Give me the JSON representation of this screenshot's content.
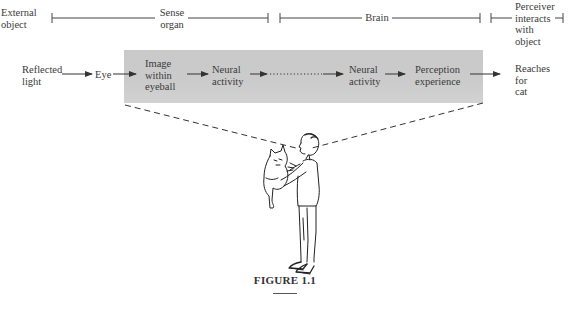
{
  "figure": {
    "caption": "FIGURE 1.1",
    "stages": {
      "external_object": "External object",
      "external_object_lines": [
        "External",
        "object"
      ],
      "sense_organ_lines": [
        "Sense",
        "organ"
      ],
      "brain": "Brain",
      "perceiver_lines": [
        "Perceiver",
        "interacts",
        "with",
        "object"
      ]
    },
    "flow": {
      "reflected_light_lines": [
        "Reflected",
        "light"
      ],
      "eye": "Eye",
      "image_lines": [
        "Image",
        "within",
        "eyeball"
      ],
      "neural1_lines": [
        "Neural",
        "activity"
      ],
      "neural2_lines": [
        "Neural",
        "activity"
      ],
      "perception_lines": [
        "Perception",
        "experience"
      ],
      "reaches_lines": [
        "Reaches",
        "for",
        "cat"
      ]
    },
    "illustration": "Person holding a cat at arm's length, looking at it",
    "colors": {
      "shade": "#c9c9c9",
      "ink": "#3a3a3a"
    }
  }
}
